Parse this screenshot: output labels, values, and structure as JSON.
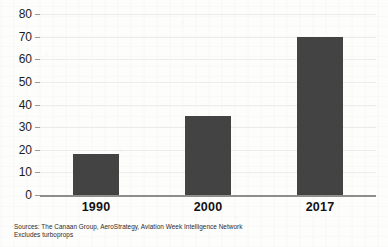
{
  "chart_data": {
    "type": "bar",
    "title": "",
    "subtitle": "",
    "xlabel": "",
    "ylabel": "",
    "categories": [
      "1990",
      "2000",
      "2017"
    ],
    "values": [
      18,
      35,
      70
    ],
    "series": [
      {
        "name": "",
        "values": [
          18,
          35,
          70
        ]
      }
    ],
    "ylim": [
      0,
      80
    ],
    "ytick_labels": [
      "0",
      "10",
      "20",
      "30",
      "40",
      "50",
      "60",
      "70",
      "80"
    ],
    "ytick_values": [
      0,
      10,
      20,
      30,
      40,
      50,
      60,
      70,
      80
    ],
    "grid": "horizontal",
    "legend": "none",
    "bar_color": "#434343",
    "gridline_color": "#ececec",
    "axis_color": "#8e8e8e",
    "annotations": [
      "Sources: The Canaan Group, AeroStrategy, Aviation Week Intelligence Network",
      "Excludes turboprops"
    ]
  },
  "caption": {
    "line1": "Sources: The Canaan Group, AeroStrategy, Aviation Week Intelligence Network",
    "line2": "Excludes turboprops"
  }
}
